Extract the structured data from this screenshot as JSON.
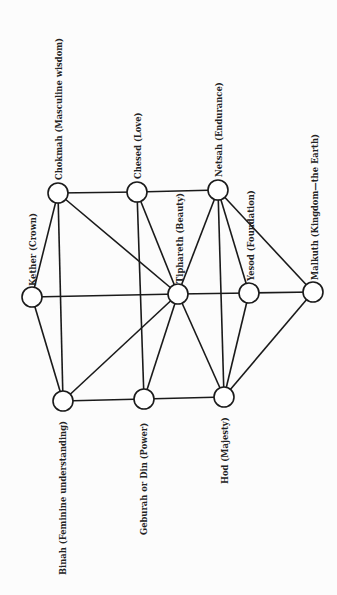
{
  "diagram": {
    "title": "",
    "orientation": "rotated -90deg (labels read bottom-to-top)",
    "colors": {
      "line": "#1a1a1a",
      "node_fill": "#ffffff",
      "background": "#fcfcfc",
      "text": "#222222"
    },
    "nodes": [
      {
        "id": "kether",
        "name": "Kether",
        "label": "Kether (Crown)",
        "x": 32,
        "y": 297,
        "lx": 36,
        "ly": 286,
        "r": 10
      },
      {
        "id": "chokmah",
        "name": "Chokmah",
        "label": "Chokmah (Masculine wisdom)",
        "x": 58,
        "y": 193,
        "lx": 62,
        "ly": 180,
        "r": 10
      },
      {
        "id": "binah",
        "name": "Binah",
        "label": "Binah (Feminine understanding)",
        "x": 63,
        "y": 401,
        "lx": 66,
        "ly": 575,
        "r": 10
      },
      {
        "id": "chesed",
        "name": "Chesed",
        "label": "Chesed (Love)",
        "x": 137,
        "y": 192,
        "lx": 141,
        "ly": 179,
        "r": 10
      },
      {
        "id": "geburah",
        "name": "Geburah",
        "label": "Geburah or Din (Power)",
        "x": 144,
        "y": 399,
        "lx": 147,
        "ly": 535,
        "r": 10
      },
      {
        "id": "tiphareth",
        "name": "Tiphareth",
        "label": "Tiphareth (Beauty)",
        "x": 178,
        "y": 294,
        "lx": 183,
        "ly": 283,
        "r": 10
      },
      {
        "id": "netsah",
        "name": "Netsah",
        "label": "Netsah (Endurance)",
        "x": 218,
        "y": 190,
        "lx": 222,
        "ly": 177,
        "r": 10
      },
      {
        "id": "hod",
        "name": "Hod",
        "label": "Hod (Majesty)",
        "x": 224,
        "y": 397,
        "lx": 228,
        "ly": 484,
        "r": 10
      },
      {
        "id": "yesod",
        "name": "Yesod",
        "label": "Yesod (Foundation)",
        "x": 249,
        "y": 293,
        "lx": 254,
        "ly": 281,
        "r": 10
      },
      {
        "id": "malkuth",
        "name": "Malkuth",
        "label": "Malkuth (Kingdom—the Earth)",
        "x": 313,
        "y": 292,
        "lx": 318,
        "ly": 280,
        "r": 10
      }
    ],
    "edges": [
      [
        "kether",
        "chokmah"
      ],
      [
        "kether",
        "binah"
      ],
      [
        "kether",
        "tiphareth"
      ],
      [
        "chokmah",
        "chesed"
      ],
      [
        "chokmah",
        "tiphareth"
      ],
      [
        "chokmah",
        "binah"
      ],
      [
        "chesed",
        "netsah"
      ],
      [
        "chesed",
        "tiphareth"
      ],
      [
        "chesed",
        "geburah"
      ],
      [
        "netsah",
        "tiphareth"
      ],
      [
        "netsah",
        "hod"
      ],
      [
        "netsah",
        "yesod"
      ],
      [
        "netsah",
        "malkuth"
      ],
      [
        "tiphareth",
        "yesod"
      ],
      [
        "yesod",
        "malkuth"
      ],
      [
        "binah",
        "tiphareth"
      ],
      [
        "binah",
        "geburah"
      ],
      [
        "geburah",
        "tiphareth"
      ],
      [
        "geburah",
        "hod"
      ],
      [
        "hod",
        "tiphareth"
      ],
      [
        "hod",
        "yesod"
      ],
      [
        "hod",
        "malkuth"
      ]
    ]
  }
}
